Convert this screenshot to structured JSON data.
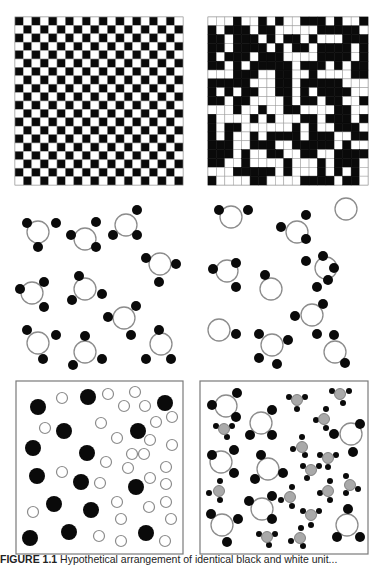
{
  "figure": {
    "caption_label": "FIGURE 1.1",
    "caption_text": "Hypothetical arrangement of identical black and white unit..."
  },
  "colors": {
    "black": "#0a0a0a",
    "white": "#ffffff",
    "grid_line": "#9a9a9a",
    "ring_stroke": "#8c8c8c",
    "gray_fill": "#a9a9a9",
    "box_border": "#7a7a7a"
  },
  "panels": {
    "ordered_grid": {
      "label": "ordered checkerboard lattice",
      "x": 15,
      "y": 17,
      "size": 168,
      "n": 20
    },
    "random_grid": {
      "label": "disordered lattice",
      "x": 208,
      "y": 17,
      "size": 160,
      "n": 19,
      "cells": [
        "0001001010011101001",
        "1011101100000111110",
        "1101110101101000111",
        "1101111010110111101",
        "1011101110000111101",
        "1101011111011101011",
        "0001110011001000011",
        "1111100011011111000",
        "1010110011010111100",
        "1101100001011011001",
        "0001001001100001100",
        "1000010100011011101",
        "1011000000101001110",
        "1010010111101110011",
        "1110011100111110100",
        "1110100110011001111",
        "1100100001000101110",
        "0001111101000101010",
        "1000011000011110110"
      ]
    },
    "molecules_complete": {
      "label": "complete molecules",
      "ring_r": 11,
      "atom_r": 5,
      "items": [
        {
          "c": [
            38,
            232
          ],
          "atoms": [
            [
              27,
              223
            ],
            [
              56,
              223
            ],
            [
              38,
              247
            ]
          ]
        },
        {
          "c": [
            85,
            239
          ],
          "atoms": [
            [
              71,
              235
            ],
            [
              96,
              222
            ],
            [
              96,
              247
            ]
          ]
        },
        {
          "c": [
            126,
            225
          ],
          "atoms": [
            [
              137,
              210
            ],
            [
              113,
              235
            ],
            [
              137,
              235
            ]
          ]
        },
        {
          "c": [
            160,
            264
          ],
          "atoms": [
            [
              146,
              258
            ],
            [
              176,
              264
            ],
            [
              159,
              282
            ]
          ]
        },
        {
          "c": [
            32,
            293
          ],
          "atoms": [
            [
              20,
              289
            ],
            [
              44,
              282
            ],
            [
              44,
              307
            ]
          ]
        },
        {
          "c": [
            85,
            289
          ],
          "atoms": [
            [
              79,
              276
            ],
            [
              72,
              300
            ],
            [
              102,
              294
            ]
          ]
        },
        {
          "c": [
            124,
            318
          ],
          "atoms": [
            [
              108,
              317
            ],
            [
              136,
              306
            ],
            [
              131,
              335
            ]
          ]
        },
        {
          "c": [
            38,
            343
          ],
          "atoms": [
            [
              27,
              330
            ],
            [
              56,
              335
            ],
            [
              43,
              359
            ]
          ]
        },
        {
          "c": [
            85,
            352
          ],
          "atoms": [
            [
              85,
              336
            ],
            [
              73,
              365
            ],
            [
              102,
              359
            ]
          ]
        },
        {
          "c": [
            161,
            344
          ],
          "atoms": [
            [
              159,
              330
            ],
            [
              146,
              359
            ],
            [
              171,
              359
            ]
          ]
        }
      ]
    },
    "molecules_scrambled": {
      "label": "scrambled molecules",
      "ring_r": 11,
      "atom_r": 5,
      "items": [
        {
          "c": [
            231,
            217
          ],
          "atoms": [
            [
              219,
              210
            ],
            [
              248,
              210
            ]
          ]
        },
        {
          "c": [
            297,
            232
          ],
          "atoms": [
            [
              281,
              227
            ],
            [
              306,
              215
            ],
            [
              306,
              239
            ]
          ]
        },
        {
          "c": [
            346,
            209
          ],
          "atoms": []
        },
        {
          "c": [
            227,
            271
          ],
          "atoms": [
            [
              213,
              269
            ],
            [
              236,
              263
            ],
            [
              236,
              287
            ]
          ]
        },
        {
          "c": [
            271,
            289
          ],
          "atoms": [
            [
              265,
              275
            ]
          ]
        },
        {
          "c": [
            326,
            268
          ],
          "atoms": [
            [
              306,
              261
            ],
            [
              323,
              256
            ],
            [
              334,
              268
            ],
            [
              328,
              280
            ],
            [
              317,
              287
            ]
          ]
        },
        {
          "c": [
            312,
            315
          ],
          "atoms": [
            [
              323,
              304
            ],
            [
              295,
              316
            ],
            [
              317,
              334
            ]
          ]
        },
        {
          "c": [
            219,
            330
          ],
          "atoms": [
            [
              236,
              334
            ]
          ]
        },
        {
          "c": [
            272,
            345
          ],
          "atoms": [
            [
              259,
              334
            ],
            [
              288,
              340
            ],
            [
              259,
              358
            ],
            [
              277,
              364
            ]
          ]
        },
        {
          "c": [
            335,
            352
          ],
          "atoms": [
            [
              334,
              335
            ],
            [
              345,
              363
            ]
          ]
        }
      ]
    },
    "mixture_spheres": {
      "label": "mixture of large black and small white spheres",
      "box": {
        "x": 16,
        "y": 381,
        "w": 167,
        "h": 173
      },
      "black_r": 8,
      "white_r": 5.5,
      "black": [
        [
          38,
          407
        ],
        [
          88,
          397
        ],
        [
          165,
          403
        ],
        [
          33,
          448
        ],
        [
          64,
          431
        ],
        [
          138,
          431
        ],
        [
          87,
          453
        ],
        [
          37,
          476
        ],
        [
          81,
          482
        ],
        [
          136,
          487
        ],
        [
          54,
          504
        ],
        [
          91,
          510
        ],
        [
          30,
          538
        ],
        [
          69,
          532
        ],
        [
          146,
          533
        ]
      ],
      "white": [
        [
          62,
          398
        ],
        [
          108,
          394
        ],
        [
          135,
          392
        ],
        [
          124,
          406
        ],
        [
          145,
          406
        ],
        [
          172,
          417
        ],
        [
          45,
          428
        ],
        [
          101,
          423
        ],
        [
          156,
          422
        ],
        [
          117,
          438
        ],
        [
          150,
          440
        ],
        [
          172,
          445
        ],
        [
          132,
          454
        ],
        [
          144,
          454
        ],
        [
          106,
          462
        ],
        [
          62,
          472
        ],
        [
          128,
          468
        ],
        [
          166,
          467
        ],
        [
          100,
          483
        ],
        [
          150,
          478
        ],
        [
          166,
          484
        ],
        [
          33,
          512
        ],
        [
          117,
          502
        ],
        [
          149,
          507
        ],
        [
          166,
          502
        ],
        [
          121,
          519
        ],
        [
          171,
          519
        ],
        [
          99,
          536
        ],
        [
          121,
          541
        ],
        [
          165,
          541
        ]
      ]
    },
    "mixture_molecules": {
      "label": "mixture of two molecular species",
      "box": {
        "x": 200,
        "y": 381,
        "w": 168,
        "h": 173
      },
      "big_ring_r": 11,
      "big_atom_r": 5,
      "small_r": 5.5,
      "small_atom_r": 3,
      "big": [
        {
          "c": [
            226,
            406
          ],
          "atoms": [
            [
              212,
              405
            ],
            [
              237,
              393
            ],
            [
              236,
              417
            ]
          ]
        },
        {
          "c": [
            261,
            423
          ],
          "atoms": [
            [
              250,
              435
            ],
            [
              272,
              410
            ],
            [
              272,
              435
            ]
          ]
        },
        {
          "c": [
            351,
            434
          ],
          "atoms": [
            [
              334,
              434
            ],
            [
              360,
              424
            ],
            [
              353,
              452
            ]
          ]
        },
        {
          "c": [
            221,
            462
          ],
          "atoms": [
            [
              212,
              455
            ],
            [
              234,
              450
            ],
            [
              234,
              473
            ]
          ]
        },
        {
          "c": [
            268,
            469
          ],
          "atoms": [
            [
              261,
              455
            ],
            [
              255,
              479
            ],
            [
              283,
              473
            ]
          ]
        },
        {
          "c": [
            262,
            509
          ],
          "atoms": [
            [
              249,
              501
            ],
            [
              272,
              496
            ],
            [
              272,
              519
            ]
          ]
        },
        {
          "c": [
            222,
            525
          ],
          "atoms": [
            [
              211,
              514
            ],
            [
              238,
              519
            ],
            [
              227,
              542
            ]
          ]
        },
        {
          "c": [
            347,
            525
          ],
          "atoms": [
            [
              348,
              509
            ],
            [
              337,
              537
            ],
            [
              360,
              537
            ]
          ]
        }
      ],
      "small": [
        {
          "c": [
            297,
            400
          ],
          "atoms": [
            [
              289,
              397
            ],
            [
              305,
              397
            ],
            [
              297,
              409
            ]
          ]
        },
        {
          "c": [
            340,
            394
          ],
          "atoms": [
            [
              332,
              391
            ],
            [
              349,
              391
            ],
            [
              343,
              403
            ]
          ]
        },
        {
          "c": [
            224,
            429
          ],
          "atoms": [
            [
              216,
              426
            ],
            [
              232,
              426
            ],
            [
              227,
              437
            ]
          ]
        },
        {
          "c": [
            324,
            419
          ],
          "atoms": [
            [
              316,
              420
            ],
            [
              326,
              409
            ],
            [
              326,
              428
            ]
          ]
        },
        {
          "c": [
            302,
            447
          ],
          "atoms": [
            [
              293,
              449
            ],
            [
              302,
              437
            ],
            [
              305,
              455
            ]
          ]
        },
        {
          "c": [
            328,
            458
          ],
          "atoms": [
            [
              320,
              455
            ],
            [
              336,
              455
            ],
            [
              328,
              467
            ]
          ]
        },
        {
          "c": [
            311,
            470
          ],
          "atoms": [
            [
              303,
              466
            ],
            [
              319,
              466
            ],
            [
              307,
              478
            ]
          ]
        },
        {
          "c": [
            219,
            491
          ],
          "atoms": [
            [
              209,
              493
            ],
            [
              220,
              481
            ],
            [
              220,
              500
            ]
          ]
        },
        {
          "c": [
            290,
            497
          ],
          "atoms": [
            [
              281,
              500
            ],
            [
              292,
              487
            ],
            [
              292,
              506
            ]
          ]
        },
        {
          "c": [
            328,
            491
          ],
          "atoms": [
            [
              320,
              493
            ],
            [
              330,
              481
            ],
            [
              330,
              500
            ]
          ]
        },
        {
          "c": [
            350,
            485
          ],
          "atoms": [
            [
              346,
              476
            ],
            [
              358,
              489
            ],
            [
              346,
              493
            ]
          ]
        },
        {
          "c": [
            311,
            515
          ],
          "atoms": [
            [
              303,
              511
            ],
            [
              319,
              511
            ],
            [
              311,
              525
            ]
          ]
        },
        {
          "c": [
            267,
            537
          ],
          "atoms": [
            [
              259,
              534
            ],
            [
              275,
              534
            ],
            [
              269,
              545
            ]
          ]
        },
        {
          "c": [
            300,
            538
          ],
          "atoms": [
            [
              291,
              541
            ],
            [
              301,
              528
            ],
            [
              303,
              546
            ]
          ]
        }
      ]
    }
  }
}
